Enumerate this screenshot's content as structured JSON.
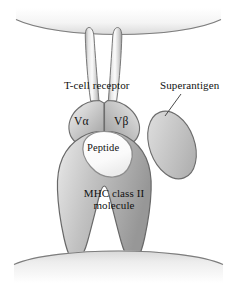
{
  "figure": {
    "background_color": "#ffffff",
    "labels": {
      "tcr": "T-cell receptor",
      "superantigen": "Superantigen",
      "v_alpha": "Vα",
      "v_beta": "Vβ",
      "peptide": "Peptide",
      "mhc_line1": "MHC class II",
      "mhc_line2": "molecule"
    },
    "structures": {
      "top_membrane": {
        "name": "t-cell-membrane",
        "fill": "#f2f2f2",
        "stroke": "#8a8a8a"
      },
      "bottom_membrane": {
        "name": "antigen-presenting-cell-membrane",
        "fill": "#efefef",
        "stroke": "#8a8a8a"
      },
      "tcr_stalks": {
        "name": "tcr-transmembrane-stalks",
        "count": 2,
        "fill": "#e3e3e3",
        "stroke": "#7e7e7e"
      },
      "v_alpha_domain": {
        "name": "v-alpha-domain",
        "fill": "#c9c9c9",
        "stroke": "#6f6f6f"
      },
      "v_beta_domain": {
        "name": "v-beta-domain",
        "fill": "#c9c9c9",
        "stroke": "#6f6f6f"
      },
      "mhc_molecule": {
        "name": "mhc-class-ii-molecule",
        "fill": "#bdbdbd",
        "stroke": "#6b6b6b"
      },
      "peptide": {
        "name": "peptide",
        "fill": "#fbfbfb",
        "stroke": "#8f8f8f"
      },
      "superantigen": {
        "name": "superantigen-ellipse",
        "fill": "#c6c6c6",
        "stroke": "#6f6f6f",
        "rotation_deg": -22
      },
      "leader_line": {
        "name": "superantigen-leader-line",
        "stroke": "#4a4a4a"
      }
    },
    "colors": {
      "outline": "#6f6f6f",
      "text": "#111111",
      "light_gray": "#e3e3e3",
      "mid_gray": "#c6c6c6",
      "dark_gray": "#9a9a9a"
    }
  }
}
